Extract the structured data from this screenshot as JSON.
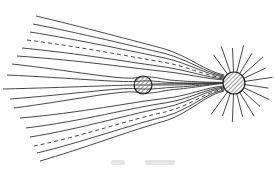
{
  "diagram": {
    "type": "field-lines",
    "colors": {
      "line": "#333333",
      "background": "#ffffff",
      "hatch": "#555555"
    },
    "small_sphere": {
      "cx": 143,
      "cy": 85,
      "r": 9,
      "fill": "hatched"
    },
    "large_sphere": {
      "cx": 234,
      "cy": 83,
      "r": 11,
      "fill": "hatched"
    },
    "dashed_lines": 2,
    "ray_count": 16
  }
}
